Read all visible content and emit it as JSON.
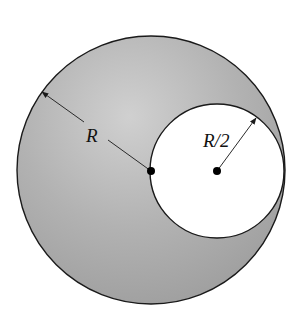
{
  "figure": {
    "type": "cavity-sphere-diagram",
    "outer_sphere": {
      "center": [
        151,
        170
      ],
      "radius": 134,
      "fill_dark": "#a4a4a4",
      "fill_light": "#d0d0d0",
      "stroke": "#1a1a1a"
    },
    "cavity": {
      "center": [
        217,
        171
      ],
      "radius": 67,
      "fill": "#ffffff",
      "stroke": "#1a1a1a"
    },
    "points": [
      {
        "name": "outer-center-dot",
        "x": 151,
        "y": 171
      },
      {
        "name": "cavity-center-dot",
        "x": 217,
        "y": 171
      }
    ],
    "dimensions": [
      {
        "name": "radius-R",
        "from": [
          151,
          171
        ],
        "to": [
          42,
          92
        ],
        "label": "R",
        "label_pos": [
          92,
          140
        ]
      },
      {
        "name": "radius-R-half",
        "from": [
          217,
          171
        ],
        "to": [
          256,
          118
        ],
        "label": "R/2",
        "label_pos": [
          204,
          145
        ]
      }
    ]
  }
}
